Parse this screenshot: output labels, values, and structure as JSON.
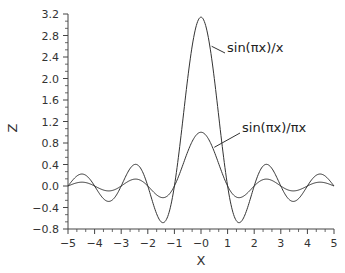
{
  "chart_data": {
    "type": "line",
    "title": "",
    "xlabel": "X",
    "ylabel": "Z",
    "xlim": [
      -5,
      5
    ],
    "ylim": [
      -0.8,
      3.2
    ],
    "grid": false,
    "legend": "none (inline annotations with leader lines)",
    "x_ticks": [
      "-5",
      "-4",
      "-3",
      "-2",
      "-1",
      "-0",
      "1",
      "2",
      "3",
      "4",
      "5"
    ],
    "y_ticks": [
      "-0.8",
      "-0.4",
      "0.0",
      "0.4",
      "0.8",
      "1.2",
      "1.6",
      "2.0",
      "2.4",
      "2.8",
      "3.2"
    ],
    "x_minor_per_major": 2,
    "y_minor_per_major": 2,
    "series": [
      {
        "name": "sin(πx)/x",
        "formula": "sin(pi*x)/x",
        "x": [
          -5,
          -4.5,
          -4,
          -3.5,
          -3,
          -2.5,
          -2,
          -1.5,
          -1,
          -0.5,
          0,
          0.5,
          1,
          1.5,
          2,
          2.5,
          3,
          3.5,
          4,
          4.5,
          5
        ],
        "values": [
          0.0,
          0.222,
          0.0,
          -0.286,
          0.0,
          0.4,
          0.0,
          -0.667,
          0.0,
          2.0,
          3.1416,
          2.0,
          0.0,
          -0.667,
          0.0,
          0.4,
          0.0,
          -0.286,
          0.0,
          0.222,
          0.0
        ]
      },
      {
        "name": "sin(πx)/πx",
        "formula": "sin(pi*x)/(pi*x)",
        "x": [
          -5,
          -4.5,
          -4,
          -3.5,
          -3,
          -2.5,
          -2,
          -1.5,
          -1,
          -0.5,
          0,
          0.5,
          1,
          1.5,
          2,
          2.5,
          3,
          3.5,
          4,
          4.5,
          5
        ],
        "values": [
          0.0,
          0.0707,
          0.0,
          -0.0909,
          0.0,
          0.127,
          0.0,
          -0.212,
          0.0,
          0.637,
          1.0,
          0.637,
          0.0,
          -0.212,
          0.0,
          0.127,
          0.0,
          -0.0909,
          0.0,
          0.0707,
          0.0
        ]
      }
    ],
    "annotations": [
      {
        "text": "sin(πx)/x",
        "label_x": 225,
        "label_y": 53,
        "anchor_x": 0.4,
        "anchor_y": 2.6
      },
      {
        "text": "sin(πx)/πx",
        "label_x": 240,
        "label_y": 133,
        "anchor_x": 0.5,
        "anchor_y": 0.72
      }
    ]
  },
  "layout": {
    "plot_left": 68,
    "plot_right": 334,
    "plot_top": 14,
    "plot_bottom": 229,
    "line_color": "#333333",
    "axis_color": "#444444"
  }
}
